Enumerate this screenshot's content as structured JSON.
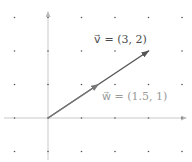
{
  "diagram": {
    "type": "vector-plot",
    "origin_px": [
      48,
      118
    ],
    "grid_step_px": 33.5,
    "grid_x": [
      -1,
      0,
      1,
      2,
      3,
      4
    ],
    "grid_y": [
      -1,
      0,
      1,
      2,
      3
    ],
    "colors": {
      "axis": "#c8c8c8",
      "grid_dot": "#555555",
      "vector_v": "#555555",
      "vector_w": "#777777",
      "label_v": "#4a4a4a",
      "label_w": "#9a9a9a"
    },
    "vectors": [
      {
        "name": "v",
        "x": 3,
        "y": 2,
        "label": "v⃗ = (3, 2)"
      },
      {
        "name": "w",
        "x": 1.5,
        "y": 1,
        "label": "w⃗ = (1.5, 1)"
      }
    ]
  }
}
